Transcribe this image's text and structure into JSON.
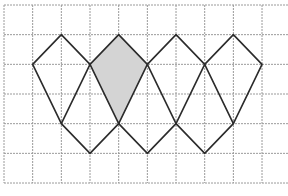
{
  "figure": {
    "grid": {
      "origin_px": [
        4,
        5
      ],
      "cell_px": [
        28.67,
        29.67
      ],
      "columns_visible": 10,
      "rows": 6,
      "line_color": "#9a9a9a"
    },
    "colors": {
      "edge": "#2b2b2b",
      "shade": "#d4d4d4",
      "background": "#ffffff"
    },
    "kites": [
      {
        "name": "kite-1",
        "vertices": [
          [
            2,
            1
          ],
          [
            3,
            2
          ],
          [
            2,
            4
          ],
          [
            1,
            2
          ]
        ],
        "shaded": false
      },
      {
        "name": "kite-2",
        "vertices": [
          [
            4,
            1
          ],
          [
            5,
            2
          ],
          [
            4,
            4
          ],
          [
            3,
            2
          ]
        ],
        "shaded": true
      },
      {
        "name": "kite-3",
        "vertices": [
          [
            6,
            1
          ],
          [
            7,
            2
          ],
          [
            6,
            4
          ],
          [
            5,
            2
          ]
        ],
        "shaded": false
      },
      {
        "name": "kite-4",
        "vertices": [
          [
            8,
            1
          ],
          [
            9,
            2
          ],
          [
            8,
            4
          ],
          [
            7,
            2
          ]
        ],
        "shaded": false
      }
    ],
    "connectors": [
      {
        "name": "v-connector-1",
        "vertices": [
          [
            2,
            4
          ],
          [
            3,
            5
          ],
          [
            4,
            4
          ]
        ]
      },
      {
        "name": "v-connector-2",
        "vertices": [
          [
            4,
            4
          ],
          [
            5,
            5
          ],
          [
            6,
            4
          ]
        ]
      },
      {
        "name": "v-connector-3",
        "vertices": [
          [
            6,
            4
          ],
          [
            7,
            5
          ],
          [
            8,
            4
          ]
        ]
      }
    ]
  },
  "caption": {
    "text": ""
  }
}
